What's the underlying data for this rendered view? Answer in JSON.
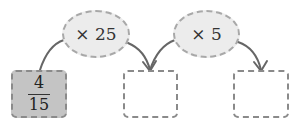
{
  "operators": [
    {
      "label": "× 25"
    },
    {
      "label": "× 5"
    }
  ],
  "boxes": [
    {
      "numerator": "4",
      "denominator": "15",
      "filled": true
    },
    {
      "numerator": "",
      "denominator": "",
      "filled": false
    },
    {
      "numerator": "",
      "denominator": "",
      "filled": false
    }
  ],
  "colors": {
    "filled_box": "#c4c4c4",
    "ellipse_fill": "#ececec",
    "arrow": "#666666"
  }
}
